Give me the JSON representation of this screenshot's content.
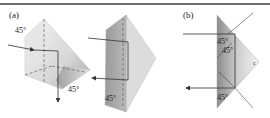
{
  "figure": {
    "panels": [
      {
        "id": "a",
        "label": "(a)",
        "angles": [
          "45°",
          "45°",
          "45°"
        ],
        "description": "Two right-angle prisms (Porro prism pair); ray enters from left, reflects twice in each prism, exits downward and leftward"
      },
      {
        "id": "b",
        "label": "(b)",
        "angles": [
          "45°",
          "45°",
          "45°"
        ],
        "corner_mark": "c",
        "description": "Cross-section of right-angle prism; horizontal ray enters, undergoes total internal reflection at two 45° faces and returns reversed"
      }
    ]
  },
  "colors": {
    "rule": "#6e6e6e",
    "prism_light": "#efefef",
    "prism_mid": "#c9c9c9",
    "prism_dark": "#8a8a8a",
    "ray": "#333333"
  }
}
